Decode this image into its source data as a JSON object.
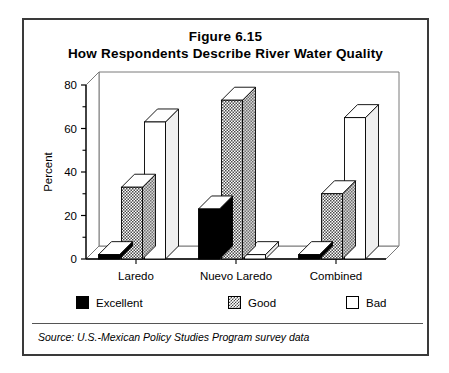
{
  "figure": {
    "title_line_1": "Figure 6.15",
    "title_line_2": "How Respondents Describe River Water Quality",
    "source": "Source:  U.S.-Mexican Policy Studies Program survey data"
  },
  "legend": {
    "items": [
      {
        "label": "Excellent",
        "swatch": "black-filled-square-icon",
        "color": "#000000"
      },
      {
        "label": "Good",
        "swatch": "gray-hatched-square-icon",
        "color": "#808080"
      },
      {
        "label": "Bad",
        "swatch": "white-empty-square-icon",
        "color": "#ffffff"
      }
    ]
  },
  "chart_data": {
    "type": "bar",
    "title": "How Respondents Describe River Water Quality",
    "xlabel": "",
    "ylabel": "Percent",
    "ylim": [
      0,
      80
    ],
    "yticks": [
      0,
      20,
      40,
      60,
      80
    ],
    "ytick_labels": [
      "0",
      "20",
      "40",
      "60",
      "80"
    ],
    "minor_tick_interval": 10,
    "grid": false,
    "legend_position": "below-plot",
    "three_d": true,
    "categories": [
      "Laredo",
      "Nuevo Laredo",
      "Combined"
    ],
    "series": [
      {
        "name": "Excellent",
        "values": [
          2,
          23,
          2
        ]
      },
      {
        "name": "Good",
        "values": [
          33,
          73,
          30
        ]
      },
      {
        "name": "Bad",
        "values": [
          63,
          2,
          65
        ]
      }
    ]
  }
}
